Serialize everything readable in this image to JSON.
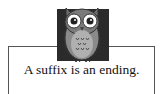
{
  "card": {
    "caption": "A suffix is an ending.",
    "icon": "owl-icon"
  }
}
